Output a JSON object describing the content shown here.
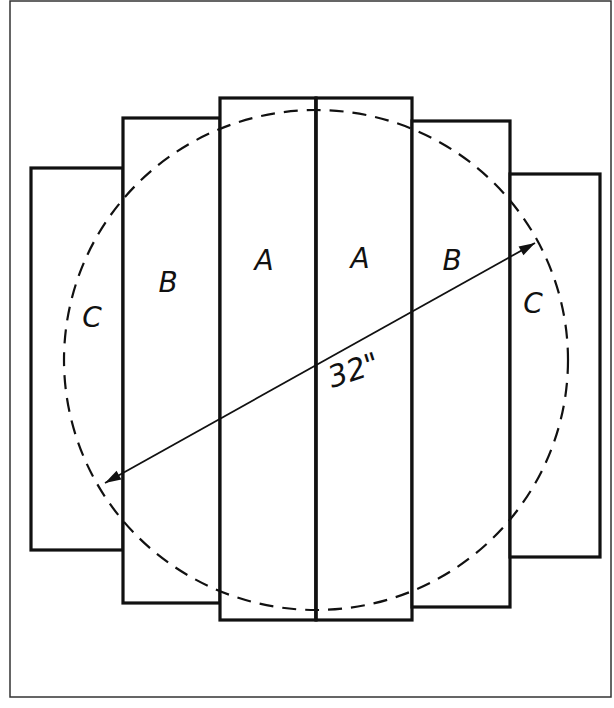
{
  "diagram": {
    "frame": {
      "x": 10,
      "y": 1,
      "w": 601,
      "h": 696
    },
    "colors": {
      "stroke": "#111111",
      "background": "#ffffff"
    },
    "panels": [
      {
        "id": "c-left",
        "label": "C",
        "x": 31,
        "y": 168,
        "w": 92,
        "h": 382,
        "lx": 92,
        "ly": 327
      },
      {
        "id": "b-left",
        "label": "B",
        "x": 123,
        "y": 118,
        "w": 97,
        "h": 485,
        "lx": 168,
        "ly": 292
      },
      {
        "id": "a-left",
        "label": "A",
        "x": 220,
        "y": 98,
        "w": 96,
        "h": 522,
        "lx": 264,
        "ly": 270
      },
      {
        "id": "a-right",
        "label": "A",
        "x": 316,
        "y": 98,
        "w": 96,
        "h": 522,
        "lx": 360,
        "ly": 268
      },
      {
        "id": "b-right",
        "label": "B",
        "x": 412,
        "y": 121,
        "w": 98,
        "h": 486,
        "lx": 452,
        "ly": 270
      },
      {
        "id": "c-right",
        "label": "C",
        "x": 510,
        "y": 174,
        "w": 90,
        "h": 383,
        "lx": 533,
        "ly": 313
      }
    ],
    "circle": {
      "cx": 316,
      "cy": 360,
      "rx": 252,
      "ry": 250,
      "style": "dashed"
    },
    "dimension": {
      "label": "32\"",
      "x1": 105,
      "y1": 483,
      "x2": 535,
      "y2": 243,
      "lx": 332,
      "ly": 388
    }
  }
}
